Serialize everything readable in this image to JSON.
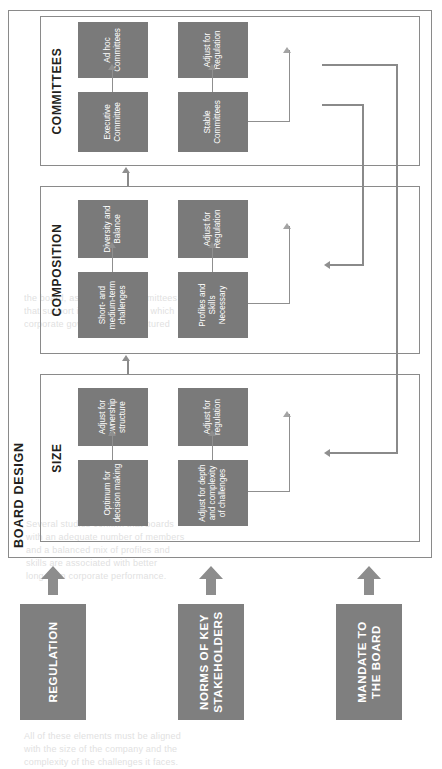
{
  "figure": {
    "container_label": "BOARD DESIGN",
    "drivers": [
      {
        "id": "regulation",
        "label": "REGULATION"
      },
      {
        "id": "norms",
        "label": "NORMS OF KEY\nSTAKEHOLDERS"
      },
      {
        "id": "mandate",
        "label": "MANDATE TO THE\nBOARD"
      }
    ],
    "driver_arrow_icon": "fat-right-arrow-icon",
    "sections": [
      {
        "id": "size",
        "title": "SIZE",
        "nodes": [
          {
            "id": "size-optimum",
            "label": "Optimum for\ndecision making"
          },
          {
            "id": "size-depth",
            "label": "Adjust for depth\nand complexity\nof challenges"
          },
          {
            "id": "size-ownership",
            "label": "Adjust for\nownership\nstructure"
          },
          {
            "id": "size-regulation",
            "label": "Adjust for\nregulation"
          }
        ]
      },
      {
        "id": "composition",
        "title": "COMPOSITION",
        "nodes": [
          {
            "id": "comp-challenges",
            "label": "Short- and\nmedium-term\nchallenges"
          },
          {
            "id": "comp-profiles",
            "label": "Profiles and Skills\nNecessary"
          },
          {
            "id": "comp-diversity",
            "label": "Diversity and\nBalance"
          },
          {
            "id": "comp-regulation",
            "label": "Adjust for\nRegulation"
          }
        ]
      },
      {
        "id": "committees",
        "title": "COMMITTEES",
        "nodes": [
          {
            "id": "comm-executive",
            "label": "Executive\nCommittee"
          },
          {
            "id": "comm-stable",
            "label": "Stable\nCommittees"
          },
          {
            "id": "comm-adhoc",
            "label": "Ad hoc\nCommittees"
          },
          {
            "id": "comm-regulation",
            "label": "Adjust for\nRegulation"
          }
        ]
      }
    ],
    "colors": {
      "node_fill": "#7a7a7a",
      "driver_fill": "#7f7f7f",
      "node_text": "#ffffff",
      "border": "#8a8a8a",
      "connector": "#8f8f8f",
      "page_background": "#ffffff",
      "heading_text": "#231f20"
    }
  },
  "page_ghost_text": {
    "block_a": "the board, as well as the committees\nthat support it, and the way in which\ncorporate governance is structured",
    "block_b": "Several studies confirm that boards\nwith an adequate number of members\nand a balanced mix of profiles and\nskills are associated with better\nlong-term corporate performance.",
    "block_c": "All of these elements must be aligned\nwith the size of the company and the\ncomplexity of the challenges it faces."
  }
}
